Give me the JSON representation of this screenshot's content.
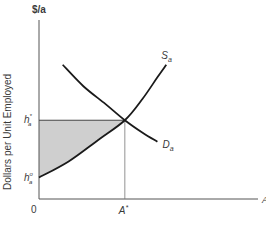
{
  "chart_data": {
    "type": "line",
    "title": "",
    "xlabel": "A",
    "ylabel": "Dollars per Unit Employed",
    "y_unit_label": "$/a",
    "origin_label": "0",
    "xlim": [
      0,
      100
    ],
    "ylim": [
      0,
      100
    ],
    "grid": false,
    "legend": "none",
    "series": [
      {
        "name": "S_a",
        "label_main": "S",
        "label_sub": "a",
        "kind": "supply",
        "points": [
          [
            0,
            12
          ],
          [
            20,
            21
          ],
          [
            40,
            33
          ],
          [
            58,
            44
          ],
          [
            70,
            56
          ],
          [
            80,
            68
          ],
          [
            86,
            75
          ]
        ]
      },
      {
        "name": "D_a",
        "label_main": "D",
        "label_sub": "a",
        "kind": "demand",
        "points": [
          [
            16,
            75
          ],
          [
            30,
            63
          ],
          [
            45,
            53
          ],
          [
            58,
            44
          ],
          [
            70,
            37
          ],
          [
            80,
            32
          ]
        ]
      }
    ],
    "equilibrium": {
      "x": 58,
      "y": 44,
      "x_label_main": "A",
      "x_label_sup": "*"
    },
    "y_ticks": [
      {
        "value": 44,
        "label_main": "h",
        "label_sub": "a",
        "label_sup": "*"
      },
      {
        "value": 12,
        "label_main": "h",
        "label_sub": "a",
        "label_sup": "o"
      }
    ],
    "shaded_region": {
      "description": "Area between h_a* horizontal line and supply curve S_a from 0 to A*",
      "color": "#cfcfcf"
    },
    "colors": {
      "curve": "#1a1a1a",
      "axis": "#555555",
      "shade": "#cfcfcf"
    }
  }
}
